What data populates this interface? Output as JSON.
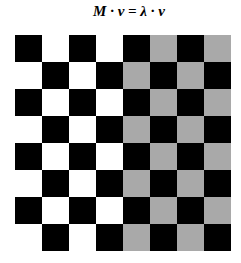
{
  "title": "M · v = λ · v",
  "grid": {
    "rows": 8,
    "cols": 8,
    "colors": {
      "dark": "#000000",
      "light_left": "#ffffff",
      "light_right": "#a9a9a9"
    },
    "split_col": 4,
    "description": "Checkerboard: dark cells where (row+col) is even; light cells white in left half (cols 0-3), gray in right half (cols 4-7)"
  }
}
